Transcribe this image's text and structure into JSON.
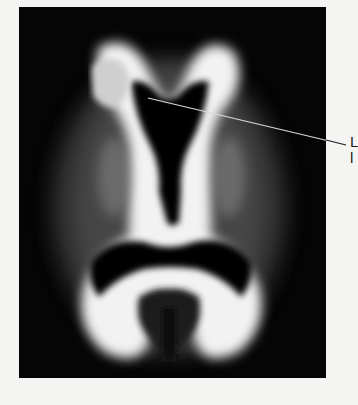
{
  "figure": {
    "type": "axial brain MRI white-matter map",
    "highlighted_region_color": "#cfcfcf",
    "background_color": "#050505",
    "page_color": "#f4f4f2"
  },
  "annotation": {
    "line1": "L",
    "line2": "l"
  }
}
